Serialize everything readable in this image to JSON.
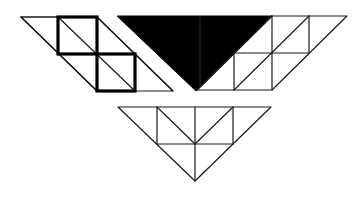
{
  "figure": {
    "colors": {
      "background": "#ffffff",
      "line": "#1a1a1a",
      "fill_black": "#000000"
    },
    "pieces": [
      {
        "id": "left-parallelogram",
        "vertices": [
          [
            21,
            17
          ],
          [
            97,
            17
          ],
          [
            173,
            91
          ],
          [
            97,
            91
          ]
        ],
        "bold_squares": [
          [
            [
              58,
              17
            ],
            [
              97,
              54
            ]
          ],
          [
            [
              97,
              54
            ],
            [
              135,
              91
            ]
          ]
        ]
      },
      {
        "id": "black-triangle",
        "vertices": [
          [
            117,
            16
          ],
          [
            272,
            16
          ],
          [
            196,
            91
          ]
        ],
        "fill": "#000000"
      },
      {
        "id": "right-parallelogram",
        "vertices": [
          [
            272,
            16
          ],
          [
            347,
            16
          ],
          [
            272,
            90
          ],
          [
            197,
            90
          ]
        ]
      },
      {
        "id": "bottom-triangle",
        "vertices": [
          [
            118,
            107
          ],
          [
            271,
            107
          ],
          [
            195,
            181
          ]
        ]
      }
    ]
  }
}
